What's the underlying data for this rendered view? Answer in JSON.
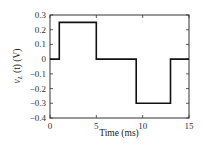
{
  "chart_data": {
    "type": "line",
    "title": "",
    "xlabel": "Time (ms)",
    "ylabel": "v_L (t) (V)",
    "xlim": [
      0,
      15
    ],
    "ylim": [
      -0.4,
      0.3
    ],
    "xticks": [
      0,
      5,
      10,
      15
    ],
    "xtick_labels": [
      "0",
      "5",
      "10",
      "15"
    ],
    "yticks": [
      0.3,
      0.2,
      0.1,
      0,
      -0.1,
      -0.2,
      -0.3,
      -0.4
    ],
    "ytick_labels": [
      "0.3",
      "0.2",
      "0.1",
      "0",
      "−0.1",
      "−0.2",
      "−0.3",
      "−0.4"
    ],
    "grid": false,
    "legend": null,
    "series": [
      {
        "name": "v_L(t)",
        "step": true,
        "x": [
          0,
          1,
          1,
          5,
          5,
          9.3,
          9.3,
          13,
          13,
          15
        ],
        "y": [
          0,
          0,
          0.25,
          0.25,
          0,
          0,
          -0.3,
          -0.3,
          0,
          0
        ]
      }
    ]
  },
  "labels": {
    "xlabel": "Time (ms)",
    "ylabel_main": "v",
    "ylabel_sub": "L",
    "ylabel_rest": " (t) (V)"
  }
}
